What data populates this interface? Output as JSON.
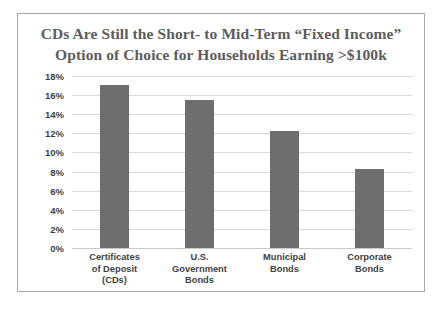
{
  "chart_data": {
    "type": "bar",
    "title": "CDs Are Still the Short- to Mid-Term “Fixed Income” Option of Choice for Households Earning >$100k",
    "title_lines": [
      "CDs Are Still the Short- to Mid-Term “Fixed Income”",
      "Option of Choice for Households Earning >$100k"
    ],
    "categories": [
      "Certificates of Deposit (CDs)",
      "U.S. Government Bonds",
      "Municipal Bonds",
      "Corporate Bonds"
    ],
    "category_lines": [
      [
        "Certificates",
        "of Deposit",
        "(CDs)"
      ],
      [
        "U.S.",
        "Government",
        "Bonds"
      ],
      [
        "Municipal",
        "Bonds"
      ],
      [
        "Corporate",
        "Bonds"
      ]
    ],
    "values": [
      17.1,
      15.5,
      12.2,
      8.3
    ],
    "xlabel": "",
    "ylabel": "",
    "ylim": [
      0,
      18
    ],
    "ytick_step": 2,
    "ytick_labels": [
      "18%",
      "16%",
      "14%",
      "12%",
      "10%",
      "8%",
      "6%",
      "4%",
      "2%",
      "0%"
    ],
    "ytick_values": [
      18,
      16,
      14,
      12,
      10,
      8,
      6,
      4,
      2,
      0
    ],
    "grid": true,
    "legend": false,
    "colors": {
      "bar": "#6e6e6e",
      "gridline": "#d9d9d9",
      "title_text": "#5c5c5c",
      "axis_text": "#3f3f3f",
      "frame_border": "#a8a8a8",
      "background": "#ffffff"
    }
  }
}
